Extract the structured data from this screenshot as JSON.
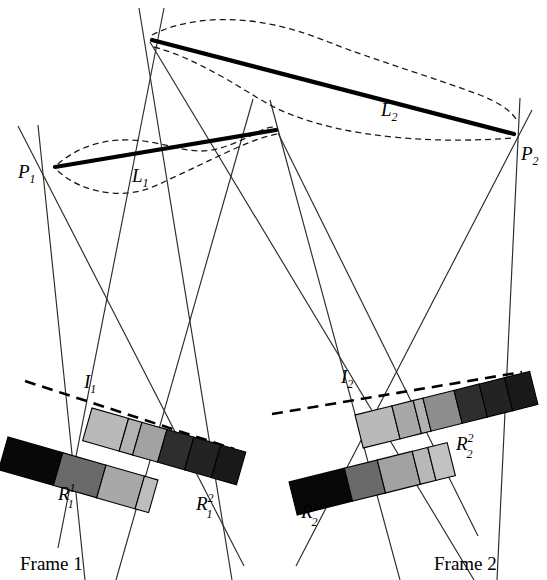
{
  "figure": {
    "background_color": "#ffffff",
    "width": 547,
    "height": 580
  },
  "labels": {
    "p1": {
      "base": "P",
      "sub": "1",
      "x": 20,
      "y": 172
    },
    "p2": {
      "base": "P",
      "sub": "2",
      "x": 521,
      "y": 158
    },
    "l1": {
      "base": "L",
      "sub": "1",
      "x": 133,
      "y": 180
    },
    "l2": {
      "base": "L",
      "sub": "2",
      "x": 383,
      "y": 114
    },
    "i1": {
      "base": "I",
      "sub": "1",
      "x": 84,
      "y": 386
    },
    "i2": {
      "base": "I",
      "sub": "2",
      "x": 343,
      "y": 381
    },
    "r1_1": {
      "base": "R",
      "sub": "1",
      "sup": "1",
      "x": 60,
      "y": 497
    },
    "r1_2": {
      "base": "R",
      "sub": "1",
      "sup": "2",
      "x": 198,
      "y": 508
    },
    "r2_1": {
      "base": "R",
      "sub": "2",
      "sup": "1",
      "x": 303,
      "y": 516
    },
    "r2_2": {
      "base": "R",
      "sub": "2",
      "sup": "2",
      "x": 458,
      "y": 447
    },
    "frame1": {
      "text": "Frame 1",
      "x": 20,
      "y": 568
    },
    "frame2": {
      "text": "Frame 2",
      "x": 436,
      "y": 568
    }
  },
  "geometry": {
    "vertices": {
      "p1": {
        "x": 55,
        "y": 166
      },
      "p2": {
        "x": 513,
        "y": 134
      },
      "apex_top": {
        "x": 152,
        "y": 40
      },
      "mid_junction": {
        "x": 275,
        "y": 130
      }
    },
    "thick_lines": [
      {
        "name": "L1",
        "x1": 55,
        "y1": 166,
        "x2": 275,
        "y2": 130
      },
      {
        "name": "L2",
        "x1": 152,
        "y1": 40,
        "x2": 513,
        "y2": 134
      }
    ],
    "uncertainty_bands": [
      {
        "name": "band-L1-upper",
        "path": "M 58 165 C 78 150 100 140 130 141 C 162 142 180 152 200 152 C 222 152 242 140 262 131 C 268 128 272 128 276 128"
      },
      {
        "name": "band-L1-lower",
        "path": "M 58 170 C 72 180 88 190 110 192 C 134 194 150 188 168 180 C 190 170 210 160 232 150 C 250 142 264 136 276 133"
      },
      {
        "name": "band-L2-upper",
        "path": "M 152 36 C 180 22 212 18 248 22 C 290 27 318 40 350 52 C 390 66 440 82 478 96 C 496 103 508 110 515 118"
      },
      {
        "name": "band-L2-lower",
        "path": "M 153 46 C 176 52 196 62 218 74 C 244 88 262 102 286 112 C 316 124 350 132 392 136 C 440 141 484 140 512 137"
      }
    ],
    "rays": [
      {
        "name": "ray-p1-vertical",
        "x1": 38,
        "y1": 125,
        "x2": 85,
        "y2": 580
      },
      {
        "name": "ray-p1-diag-down",
        "x1": 18,
        "y1": 126,
        "x2": 240,
        "y2": 560
      },
      {
        "name": "ray-apex-left",
        "x1": 163,
        "y1": 8,
        "x2": 60,
        "y2": 545
      },
      {
        "name": "ray-apex-fan-a",
        "x1": 140,
        "y1": 8,
        "x2": 230,
        "y2": 580
      },
      {
        "name": "ray-mid-left-down",
        "x1": 252,
        "y1": 100,
        "x2": 118,
        "y2": 580
      },
      {
        "name": "ray-mid-right-down",
        "x1": 270,
        "y1": 100,
        "x2": 398,
        "y2": 580
      },
      {
        "name": "ray-p2-vertical",
        "x1": 519,
        "y1": 100,
        "x2": 498,
        "y2": 580
      },
      {
        "name": "ray-p2-diag-down-left",
        "x1": 527,
        "y1": 112,
        "x2": 300,
        "y2": 560
      },
      {
        "name": "ray-cross-to-frame2-a",
        "x1": 150,
        "y1": 42,
        "x2": 470,
        "y2": 580
      },
      {
        "name": "ray-cross-to-frame1-a",
        "x1": 278,
        "y1": 132,
        "x2": 470,
        "y2": 520
      }
    ],
    "image_planes": [
      {
        "name": "I1",
        "x1": 25,
        "y1": 381,
        "x2": 232,
        "y2": 448
      },
      {
        "name": "I2",
        "x1": 275,
        "y1": 412,
        "x2": 520,
        "y2": 372
      }
    ]
  },
  "bars": {
    "frame1": {
      "lower_bar": {
        "name": "R1-superscript-1",
        "origin": {
          "x": 8,
          "y": 437
        },
        "rotation_deg": 16,
        "seg_w": 57,
        "height": 34,
        "segments": [
          "#080808",
          "#6a6a6a",
          "#a8a8a8",
          "#c4c4c4"
        ]
      },
      "upper_bar": {
        "name": "R1-superscript-2",
        "origin": {
          "x": 92,
          "y": 408
        },
        "rotation_deg": 16,
        "seg_w": 25,
        "height": 34,
        "segments": [
          "#b8b8b8",
          "#b0b0b0",
          "#9a9a9a",
          "#a0a0a0",
          "#303030",
          "#262626",
          "#1c1c1c",
          "#141414"
        ]
      }
    },
    "frame2": {
      "upper_bar": {
        "name": "R2-superscript-2",
        "origin": {
          "x": 355,
          "y": 413
        },
        "rotation_deg": -14,
        "seg_w": 25,
        "height": 34,
        "segments": [
          "#b8b8b8",
          "#b0b0b0",
          "#9a9a9a",
          "#9a9a9a",
          "#8e8e8e",
          "#303030",
          "#262626",
          "#1c1c1c",
          "#141414"
        ]
      },
      "lower_bar": {
        "name": "R2-superscript-1",
        "origin": {
          "x": 289,
          "y": 480
        },
        "rotation_deg": -14,
        "seg_w": 57,
        "height": 34,
        "segments": [
          "#080808",
          "#6a6a6a",
          "#a8a8a8",
          "#c4c4c4"
        ]
      }
    }
  },
  "colors": {
    "line": "#2b2b2b",
    "thick_line": "#000000",
    "dashed": "#1a1a1a",
    "text": "#000000",
    "background": "#ffffff"
  }
}
